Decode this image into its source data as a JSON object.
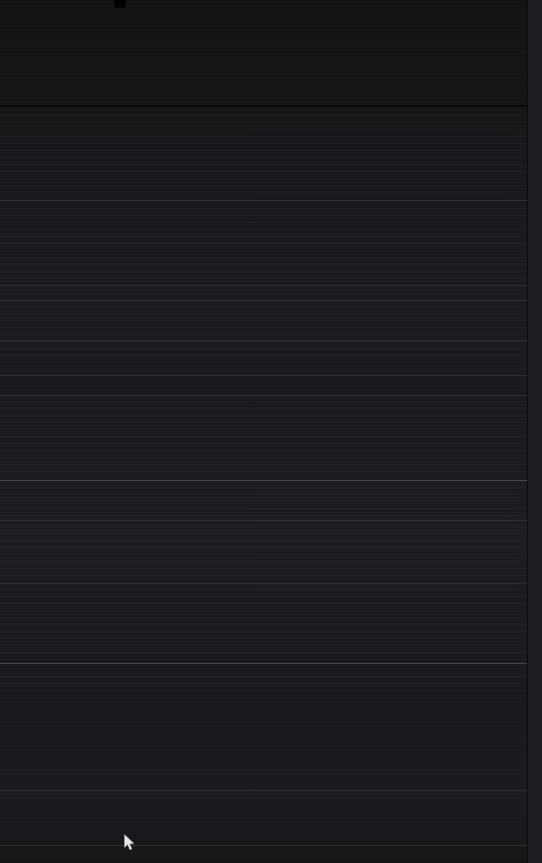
{
  "capture": {
    "width": 542,
    "height": 863,
    "appearance": "dark",
    "legible_text": "none",
    "description": "Near-black screen capture; no text, icons or labels are resolvable at any zoom level.",
    "background_color": "#16161a",
    "right_margin_color": "#1d1d22",
    "divider_color": "#2a2a30",
    "cursor_color": "#e8e8e8"
  },
  "regions": [
    {
      "name": "top-area",
      "top": 0,
      "height": 105,
      "content": "flat dark area"
    },
    {
      "name": "upper-section",
      "top": 106,
      "height": 94,
      "content": "faint striations"
    },
    {
      "name": "mid-section-a",
      "top": 201,
      "height": 99,
      "content": "dense striations"
    },
    {
      "name": "mid-section-b",
      "top": 301,
      "height": 94,
      "content": "dense striations"
    },
    {
      "name": "mid-section-c",
      "top": 396,
      "height": 84,
      "content": "faint striations"
    },
    {
      "name": "mid-section-d",
      "top": 481,
      "height": 102,
      "content": "dense striations"
    },
    {
      "name": "lower-section-a",
      "top": 584,
      "height": 79,
      "content": "faint striations"
    },
    {
      "name": "lower-section-b",
      "top": 664,
      "height": 126,
      "content": "flat dark area"
    },
    {
      "name": "bottom-section",
      "top": 791,
      "height": 72,
      "content": "flat dark area"
    }
  ],
  "dividers": [
    {
      "y": 105,
      "weight": "dark"
    },
    {
      "y": 200,
      "weight": "normal"
    },
    {
      "y": 285,
      "weight": "normal"
    },
    {
      "y": 300,
      "weight": "normal"
    },
    {
      "y": 340,
      "weight": "normal"
    },
    {
      "y": 375,
      "weight": "normal"
    },
    {
      "y": 395,
      "weight": "normal"
    },
    {
      "y": 480,
      "weight": "strong"
    },
    {
      "y": 520,
      "weight": "normal"
    },
    {
      "y": 583,
      "weight": "normal"
    },
    {
      "y": 663,
      "weight": "strong"
    },
    {
      "y": 790,
      "weight": "normal"
    },
    {
      "y": 845,
      "weight": "normal"
    }
  ],
  "text_bands": [
    {
      "top": 112,
      "height": 86
    },
    {
      "top": 205,
      "height": 78
    },
    {
      "top": 303,
      "height": 70
    },
    {
      "top": 398,
      "height": 78
    },
    {
      "top": 484,
      "height": 34
    },
    {
      "top": 523,
      "height": 58
    },
    {
      "top": 586,
      "height": 74
    },
    {
      "top": 666,
      "height": 30
    }
  ],
  "cursor": {
    "name": "mouse-pointer",
    "x": 124,
    "y": 834
  }
}
